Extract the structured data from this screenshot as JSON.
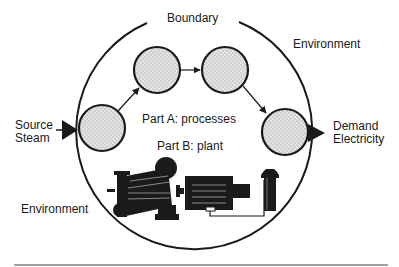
{
  "diagram": {
    "boundary_label": "Boundary",
    "environment_label_top": "Environment",
    "environment_label_bottom": "Environment",
    "source": {
      "line1": "Source",
      "line2": "Steam"
    },
    "demand": {
      "line1": "Demand",
      "line2": "Electricity"
    },
    "part_a_label": "Part A: processes",
    "part_b_label": "Part B: plant",
    "process_nodes": [
      {
        "id": "process-1"
      },
      {
        "id": "process-2"
      },
      {
        "id": "process-3"
      },
      {
        "id": "process-4"
      }
    ],
    "plant_components": [
      "turbine-icon",
      "generator-icon",
      "valve-icon"
    ],
    "colors": {
      "stroke": "#1a1a1a",
      "node_fill": "#dcdcdc",
      "background": "#ffffff"
    }
  }
}
